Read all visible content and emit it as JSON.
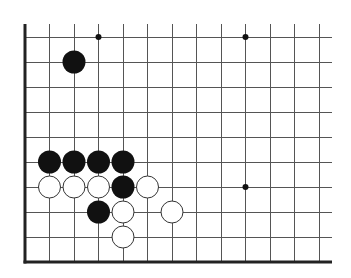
{
  "board": {
    "title": "Go board position (partial, lower-left corner)",
    "grid": {
      "columns": 13,
      "rows": 10,
      "origin_x": 25,
      "origin_y": 37,
      "spacing_x": 24.5,
      "spacing_y": 25,
      "line_top_extend_y": 24,
      "line_right_extend_x": 332,
      "open_edges": [
        "top",
        "right"
      ],
      "border_edges": [
        "left",
        "bottom"
      ]
    },
    "colors": {
      "background": "#ffffff",
      "grid_line": "#555555",
      "border_line": "#222222",
      "black_stone": "#111111",
      "white_stone_fill": "#ffffff",
      "white_stone_stroke": "#333333",
      "star_point": "#111111"
    },
    "star_points": [
      {
        "col": 3,
        "row": 0
      },
      {
        "col": 9,
        "row": 0
      },
      {
        "col": 9,
        "row": 6
      }
    ],
    "stones": [
      {
        "color": "black",
        "col": 2,
        "row": 1
      },
      {
        "color": "black",
        "col": 1,
        "row": 5
      },
      {
        "color": "black",
        "col": 2,
        "row": 5
      },
      {
        "color": "black",
        "col": 3,
        "row": 5
      },
      {
        "color": "black",
        "col": 4,
        "row": 5
      },
      {
        "color": "white",
        "col": 1,
        "row": 6
      },
      {
        "color": "white",
        "col": 2,
        "row": 6
      },
      {
        "color": "white",
        "col": 3,
        "row": 6
      },
      {
        "color": "black",
        "col": 4,
        "row": 6
      },
      {
        "color": "white",
        "col": 5,
        "row": 6
      },
      {
        "color": "black",
        "col": 3,
        "row": 7
      },
      {
        "color": "white",
        "col": 4,
        "row": 7
      },
      {
        "color": "white",
        "col": 6,
        "row": 7
      },
      {
        "color": "white",
        "col": 4,
        "row": 8
      }
    ],
    "stone_radius": 11.5,
    "star_radius": 3
  }
}
